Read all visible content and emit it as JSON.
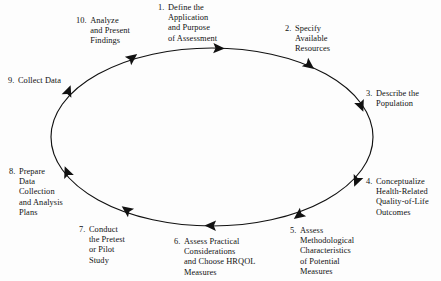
{
  "diagram": {
    "title": "",
    "type": "cyclical-process",
    "direction": "clockwise",
    "background_color": "#fdfdfd",
    "stroke_color": "#111111",
    "ellipse": {
      "cx": 212,
      "cy": 137,
      "rx": 161,
      "ry": 89
    },
    "steps": [
      {
        "number": "1.",
        "lines": [
          "Define the",
          "Application",
          "and Purpose",
          "of Assessment"
        ]
      },
      {
        "number": "2.",
        "lines": [
          "Specify",
          "Available",
          "Resources"
        ]
      },
      {
        "number": "3.",
        "lines": [
          "Describe the",
          "Population"
        ]
      },
      {
        "number": "4.",
        "lines": [
          "Conceptualize",
          "Health-Related",
          "Quality-of-Life",
          "Outcomes"
        ]
      },
      {
        "number": "5.",
        "lines": [
          "Assess",
          "Methodological",
          "Characteristics",
          "of Potential",
          "Measures"
        ]
      },
      {
        "number": "6.",
        "lines": [
          "Assess Practical",
          "Considerations",
          "and Choose HRQOL",
          "Measures"
        ]
      },
      {
        "number": "7.",
        "lines": [
          "Conduct",
          "the Pretest",
          "or Pilot",
          "Study"
        ]
      },
      {
        "number": "8.",
        "lines": [
          "Prepare",
          "Data",
          "Collection",
          "and Analysis",
          "Plans"
        ]
      },
      {
        "number": "9.",
        "lines": [
          "Collect Data"
        ]
      },
      {
        "number": "10.",
        "lines": [
          "Analyze",
          "and Present",
          "Findings"
        ]
      }
    ],
    "arrow_markers": [
      {
        "name": "arrow-to-step-1",
        "angle_deg": -75
      },
      {
        "name": "arrow-to-step-2",
        "angle_deg": -38
      },
      {
        "name": "arrow-to-step-3",
        "angle_deg": -10
      },
      {
        "name": "arrow-to-step-4",
        "angle_deg": 25
      },
      {
        "name": "arrow-to-step-5",
        "angle_deg": 55
      },
      {
        "name": "arrow-to-step-6",
        "angle_deg": 92
      },
      {
        "name": "arrow-to-step-7",
        "angle_deg": 128
      },
      {
        "name": "arrow-to-step-8",
        "angle_deg": 160
      },
      {
        "name": "arrow-to-step-9",
        "angle_deg": 198
      },
      {
        "name": "arrow-to-step-10",
        "angle_deg": 238
      }
    ]
  }
}
